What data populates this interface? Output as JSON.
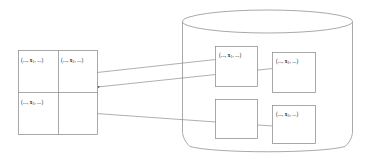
{
  "diagram": {
    "stroke_color": "#808080",
    "text_color": "#1a1a1a",
    "background_color": "#ffffff"
  },
  "table": {
    "name": "left-tuple-table",
    "rows": 2,
    "columns": 2,
    "cells": [
      {
        "id": "r1c1",
        "text_prefix": "(..., ",
        "symbol": "x",
        "subscript": "1",
        "text_suffix": ", ...)",
        "full_text": "(..., x1, ...)",
        "empty": false
      },
      {
        "id": "r1c2",
        "text_prefix": "(..., ",
        "symbol": "x",
        "subscript": "2",
        "text_suffix": ", ...)",
        "full_text": "(..., x2, ...)",
        "empty": false
      },
      {
        "id": "r2c1",
        "text_prefix": "(..., ",
        "symbol": "x",
        "subscript": "3",
        "text_suffix": ", ...)",
        "full_text": "(..., x3, ...)",
        "empty": false
      },
      {
        "id": "r2c2",
        "text_prefix": "",
        "symbol": "",
        "subscript": "",
        "text_suffix": "",
        "full_text": "",
        "empty": true
      }
    ]
  },
  "cylinder": {
    "name": "database-cylinder",
    "label": "database",
    "boxes": [
      {
        "id": "db-box-1",
        "text_prefix": "(..., ",
        "symbol": "x",
        "subscript": "1",
        "text_suffix": ", ...)",
        "full_text": "(..., x1, ...)",
        "empty": false
      },
      {
        "id": "db-box-2",
        "text_prefix": "(..., ",
        "symbol": "x",
        "subscript": "2",
        "text_suffix": ", ...)",
        "full_text": "(..., x2, ...)",
        "empty": false
      },
      {
        "id": "db-box-3",
        "text_prefix": "",
        "symbol": "",
        "subscript": "",
        "text_suffix": "",
        "full_text": "",
        "empty": true
      },
      {
        "id": "db-box-4",
        "text_prefix": "(..., ",
        "symbol": "x",
        "subscript": "3",
        "text_suffix": ", ...)",
        "full_text": "(..., x3, ...)",
        "empty": false
      }
    ]
  },
  "arrows": [
    {
      "id": "arrow-1",
      "from": "db-box-1",
      "to": "r1c2",
      "direction": "left"
    },
    {
      "id": "arrow-2",
      "from": "db-box-2",
      "to": "r1c2-right-edge",
      "direction": "left"
    },
    {
      "id": "arrow-3",
      "from": "db-box-4",
      "to": "r2c1",
      "direction": "left"
    }
  ]
}
